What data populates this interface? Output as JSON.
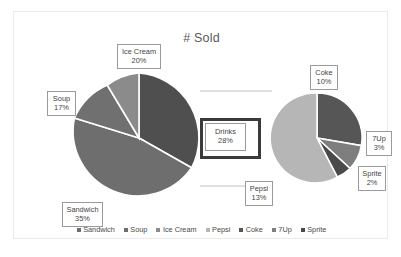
{
  "chart": {
    "title": "# Sold",
    "type": "pie-of-pie"
  },
  "legend": {
    "entries": [
      {
        "label": "Sandwich",
        "color": "#6e6e6e"
      },
      {
        "label": "Soup",
        "color": "#6e6e6e"
      },
      {
        "label": "Ice Cream",
        "color": "#8b8b8b"
      },
      {
        "label": "Pepsi",
        "color": "#b6b6b6"
      },
      {
        "label": "Coke",
        "color": "#565656"
      },
      {
        "label": "7Up",
        "color": "#7e7e7e"
      },
      {
        "label": "Sprite",
        "color": "#4a4a4a"
      }
    ]
  },
  "callouts": {
    "ice_cream": {
      "category": "Ice Cream",
      "percent": "20%"
    },
    "soup": {
      "category": "Soup",
      "percent": "17%"
    },
    "sandwich": {
      "category": "Sandwich",
      "percent": "35%"
    },
    "drinks": {
      "category": "Drinks",
      "percent": "28%"
    },
    "coke": {
      "category": "Coke",
      "percent": "10%"
    },
    "sevenup": {
      "category": "7Up",
      "percent": "3%"
    },
    "sprite": {
      "category": "Sprite",
      "percent": "2%"
    },
    "pepsi": {
      "category": "Pepsi",
      "percent": "13%"
    }
  },
  "chart_data": {
    "type": "pie",
    "title": "# Sold",
    "xlabel": "",
    "ylabel": "",
    "legend_position": "bottom",
    "grid": false,
    "primary_pie": {
      "name": "Main categories",
      "categories": [
        "Sandwich",
        "Soup",
        "Ice Cream",
        "Drinks"
      ],
      "values": [
        35,
        17,
        20,
        28
      ],
      "labels": [
        "Sandwich 35%",
        "Soup 17%",
        "Ice Cream 20%",
        "Drinks 28%"
      ],
      "colors": [
        "#6e6e6e",
        "#6e6e6e",
        "#8b8b8b",
        "#4f4f4f"
      ],
      "units": "percent"
    },
    "secondary_pie": {
      "name": "Drinks breakdown",
      "exploded_from": "Drinks",
      "exploded_total": 28,
      "categories": [
        "Coke",
        "Pepsi",
        "7Up",
        "Sprite"
      ],
      "values": [
        10,
        13,
        3,
        2
      ],
      "labels": [
        "Coke 10%",
        "Pepsi 13%",
        "7Up 3%",
        "Sprite 2%"
      ],
      "colors": [
        "#565656",
        "#b6b6b6",
        "#7e7e7e",
        "#4a4a4a"
      ],
      "units": "percent"
    },
    "all_categories": [
      "Sandwich",
      "Soup",
      "Ice Cream",
      "Pepsi",
      "Coke",
      "7Up",
      "Sprite"
    ],
    "all_values": [
      35,
      17,
      20,
      13,
      10,
      3,
      2
    ]
  }
}
